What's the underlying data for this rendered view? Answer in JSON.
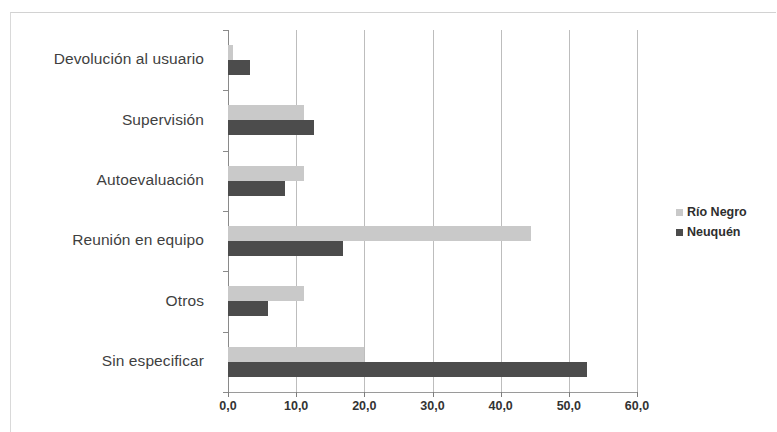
{
  "chart_data": {
    "type": "bar",
    "orientation": "horizontal",
    "title": "",
    "subtitle": "",
    "xlabel": "",
    "ylabel": "",
    "xlim": [
      0,
      60
    ],
    "xticks": [
      0,
      10,
      20,
      30,
      40,
      50,
      60
    ],
    "xtick_labels": [
      "0,0",
      "10,0",
      "20,0",
      "30,0",
      "40,0",
      "50,0",
      "60,0"
    ],
    "grid": true,
    "grid_axis": "x",
    "legend_position": "right",
    "categories": [
      "Devolución al usuario",
      "Supervisión",
      "Autoevaluación",
      "Reunión en equipo",
      "Otros",
      "Sin especificar"
    ],
    "series": [
      {
        "name": "Río Negro",
        "color": "#c9c9c9",
        "values": [
          0.8,
          11.2,
          11.2,
          44.5,
          11.2,
          20.0
        ]
      },
      {
        "name": "Neuquén",
        "color": "#4c4c4c",
        "values": [
          3.2,
          12.6,
          8.4,
          16.8,
          5.8,
          52.7
        ]
      }
    ]
  },
  "legend": {
    "items": [
      {
        "label": "Río Negro",
        "color": "#c9c9c9",
        "marker": "square-swatch"
      },
      {
        "label": "Neuquén",
        "color": "#4c4c4c",
        "marker": "square-swatch"
      }
    ]
  }
}
